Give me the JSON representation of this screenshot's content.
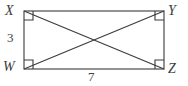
{
  "figure": {
    "kind": "geometry-diagram",
    "background_color": "#ffffff",
    "stroke_color": "#3b3b3b",
    "text_color": "#3b3b3b",
    "vertices": [
      {
        "id": "X",
        "label": "X",
        "position": "top-left",
        "x": 24,
        "y": 11
      },
      {
        "id": "Y",
        "label": "Y",
        "position": "top-right",
        "x": 164,
        "y": 11
      },
      {
        "id": "W",
        "label": "W",
        "position": "bottom-left",
        "x": 24,
        "y": 69
      },
      {
        "id": "Z",
        "label": "Z",
        "position": "bottom-right",
        "x": 164,
        "y": 69
      }
    ],
    "rectangle": {
      "left": 24,
      "top": 11,
      "right": 164,
      "bottom": 69,
      "width": 140,
      "height": 58
    },
    "right_angle_marks": {
      "count": 4,
      "size": 9,
      "at": [
        "X",
        "Y",
        "W",
        "Z"
      ]
    },
    "diagonals": [
      {
        "from": "X",
        "to": "Z"
      },
      {
        "from": "W",
        "to": "Y"
      }
    ],
    "diagonal_intersection": {
      "x": 94,
      "y": 40
    },
    "measurements": [
      {
        "id": "side-left",
        "label": "3",
        "side": "WX",
        "orientation": "vertical"
      },
      {
        "id": "side-bottom",
        "label": "7",
        "side": "WZ",
        "orientation": "horizontal"
      }
    ]
  }
}
